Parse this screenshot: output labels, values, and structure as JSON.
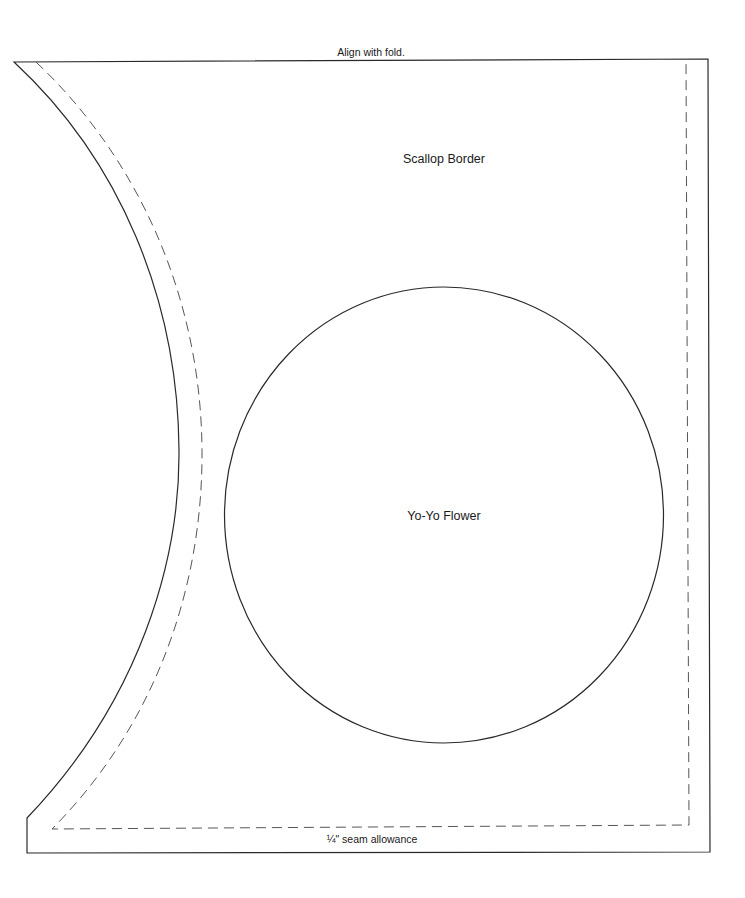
{
  "pattern": {
    "labels": {
      "fold": "Align with fold.",
      "piece_name": "Scallop Border",
      "circle_name": "Yo-Yo Flower",
      "seam": "¼\" seam allowance"
    },
    "colors": {
      "cut_line": "#2a2a2a",
      "seam_line": "#555555",
      "background": "#ffffff"
    }
  }
}
